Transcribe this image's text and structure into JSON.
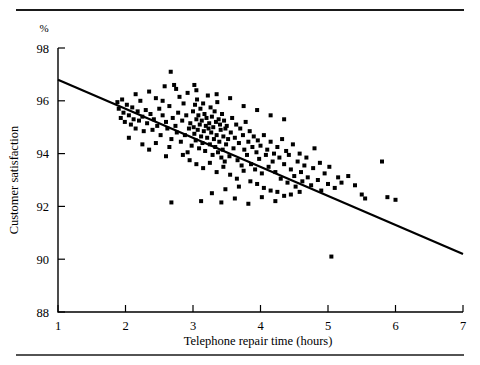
{
  "figure": {
    "name": "telephone-repair-satisfaction-scatter",
    "top_rule": true,
    "bottom_rule": true,
    "percent_symbol": "%"
  },
  "chart_data": {
    "type": "scatter",
    "title": "",
    "subtitle": "",
    "xlabel": "Telephone repair time (hours)",
    "ylabel": "Customer satisfaction",
    "yunit": "%",
    "xlim": [
      1,
      7
    ],
    "ylim": [
      88,
      98
    ],
    "xticks": [
      1,
      2,
      3,
      4,
      5,
      6,
      7
    ],
    "yticks": [
      88,
      90,
      92,
      94,
      96,
      98
    ],
    "xticklabels": [
      "1",
      "2",
      "3",
      "4",
      "5",
      "6",
      "7"
    ],
    "yticklabels": [
      "88",
      "90",
      "92",
      "94",
      "96",
      "98"
    ],
    "grid": false,
    "legend": false,
    "marker": "square",
    "marker_color": "#000000",
    "marker_size_px": 4,
    "trendline": {
      "type": "linear-regression",
      "x": [
        1,
        7
      ],
      "y": [
        96.8,
        90.2
      ],
      "slope": -1.1,
      "intercept": 97.9,
      "color": "#000000",
      "width_px": 2.2
    },
    "n_points": 221,
    "points": [
      [
        1.88,
        95.95
      ],
      [
        1.9,
        95.7
      ],
      [
        1.93,
        95.35
      ],
      [
        1.95,
        96.05
      ],
      [
        1.97,
        95.55
      ],
      [
        1.99,
        95.2
      ],
      [
        2.02,
        95.85
      ],
      [
        2.05,
        95.45
      ],
      [
        2.08,
        95.1
      ],
      [
        2.1,
        95.75
      ],
      [
        2.12,
        95.3
      ],
      [
        2.15,
        94.95
      ],
      [
        2.18,
        95.6
      ],
      [
        2.2,
        95.25
      ],
      [
        2.22,
        96.0
      ],
      [
        2.25,
        95.4
      ],
      [
        2.27,
        94.85
      ],
      [
        2.3,
        95.65
      ],
      [
        2.32,
        95.15
      ],
      [
        2.35,
        96.35
      ],
      [
        2.37,
        95.5
      ],
      [
        2.4,
        94.9
      ],
      [
        2.42,
        95.3
      ],
      [
        2.45,
        96.1
      ],
      [
        2.47,
        95.05
      ],
      [
        2.5,
        95.7
      ],
      [
        2.52,
        94.7
      ],
      [
        2.55,
        95.45
      ],
      [
        2.58,
        96.55
      ],
      [
        2.6,
        95.2
      ],
      [
        2.62,
        94.95
      ],
      [
        2.65,
        95.8
      ],
      [
        2.67,
        97.1
      ],
      [
        2.68,
        94.55
      ],
      [
        2.7,
        95.35
      ],
      [
        2.72,
        96.6
      ],
      [
        2.74,
        95.05
      ],
      [
        2.76,
        94.8
      ],
      [
        2.78,
        95.55
      ],
      [
        2.8,
        96.15
      ],
      [
        2.82,
        94.45
      ],
      [
        2.84,
        95.25
      ],
      [
        2.86,
        95.9
      ],
      [
        2.88,
        94.7
      ],
      [
        2.9,
        95.45
      ],
      [
        2.92,
        96.3
      ],
      [
        2.94,
        94.95
      ],
      [
        2.96,
        95.15
      ],
      [
        2.98,
        94.3
      ],
      [
        3.0,
        95.6
      ],
      [
        3.01,
        95.0
      ],
      [
        3.02,
        94.75
      ],
      [
        3.03,
        95.85
      ],
      [
        3.04,
        94.5
      ],
      [
        3.05,
        95.3
      ],
      [
        3.06,
        96.05
      ],
      [
        3.07,
        94.9
      ],
      [
        3.08,
        95.45
      ],
      [
        3.09,
        94.2
      ],
      [
        3.1,
        95.1
      ],
      [
        3.11,
        95.7
      ],
      [
        3.12,
        94.65
      ],
      [
        3.13,
        95.25
      ],
      [
        3.14,
        94.4
      ],
      [
        3.15,
        95.9
      ],
      [
        3.16,
        94.85
      ],
      [
        3.17,
        95.5
      ],
      [
        3.18,
        94.1
      ],
      [
        3.19,
        95.05
      ],
      [
        3.2,
        95.35
      ],
      [
        3.21,
        94.6
      ],
      [
        3.22,
        96.2
      ],
      [
        3.23,
        94.95
      ],
      [
        3.24,
        95.15
      ],
      [
        3.25,
        94.35
      ],
      [
        3.26,
        95.75
      ],
      [
        3.27,
        94.8
      ],
      [
        3.28,
        95.4
      ],
      [
        3.29,
        93.95
      ],
      [
        3.3,
        95.0
      ],
      [
        3.31,
        94.55
      ],
      [
        3.32,
        95.6
      ],
      [
        3.33,
        94.25
      ],
      [
        3.34,
        95.2
      ],
      [
        3.35,
        94.7
      ],
      [
        3.36,
        95.95
      ],
      [
        3.37,
        94.05
      ],
      [
        3.38,
        95.3
      ],
      [
        3.39,
        94.45
      ],
      [
        3.4,
        95.1
      ],
      [
        3.41,
        94.9
      ],
      [
        3.42,
        93.85
      ],
      [
        3.43,
        95.5
      ],
      [
        3.44,
        94.15
      ],
      [
        3.45,
        94.65
      ],
      [
        3.46,
        95.25
      ],
      [
        3.47,
        93.7
      ],
      [
        3.48,
        94.95
      ],
      [
        3.49,
        94.35
      ],
      [
        3.5,
        95.05
      ],
      [
        3.52,
        94.55
      ],
      [
        3.54,
        93.9
      ],
      [
        3.56,
        94.8
      ],
      [
        3.58,
        95.35
      ],
      [
        3.6,
        94.2
      ],
      [
        3.62,
        94.6
      ],
      [
        3.64,
        95.1
      ],
      [
        3.66,
        93.75
      ],
      [
        3.68,
        94.4
      ],
      [
        3.7,
        94.95
      ],
      [
        3.72,
        93.55
      ],
      [
        3.74,
        94.7
      ],
      [
        3.76,
        94.15
      ],
      [
        3.78,
        95.2
      ],
      [
        3.8,
        93.95
      ],
      [
        3.82,
        94.45
      ],
      [
        3.84,
        94.85
      ],
      [
        3.86,
        93.6
      ],
      [
        3.88,
        94.25
      ],
      [
        3.9,
        94.65
      ],
      [
        3.92,
        93.4
      ],
      [
        3.94,
        94.05
      ],
      [
        3.96,
        94.5
      ],
      [
        3.98,
        93.8
      ],
      [
        4.0,
        94.3
      ],
      [
        4.02,
        93.25
      ],
      [
        4.05,
        94.7
      ],
      [
        4.08,
        93.95
      ],
      [
        4.1,
        94.15
      ],
      [
        4.12,
        93.5
      ],
      [
        4.15,
        94.45
      ],
      [
        4.18,
        93.7
      ],
      [
        4.2,
        94.0
      ],
      [
        4.22,
        93.3
      ],
      [
        4.25,
        94.25
      ],
      [
        4.28,
        93.85
      ],
      [
        4.3,
        93.05
      ],
      [
        4.32,
        94.55
      ],
      [
        4.35,
        93.6
      ],
      [
        4.38,
        94.1
      ],
      [
        4.4,
        92.9
      ],
      [
        4.42,
        93.95
      ],
      [
        4.45,
        93.4
      ],
      [
        4.48,
        94.35
      ],
      [
        4.5,
        93.15
      ],
      [
        4.52,
        92.75
      ],
      [
        4.55,
        93.7
      ],
      [
        4.58,
        94.0
      ],
      [
        4.6,
        93.3
      ],
      [
        4.62,
        92.95
      ],
      [
        4.65,
        93.55
      ],
      [
        4.68,
        93.85
      ],
      [
        4.7,
        93.1
      ],
      [
        4.75,
        92.8
      ],
      [
        4.78,
        93.45
      ],
      [
        4.8,
        94.2
      ],
      [
        4.85,
        93.0
      ],
      [
        4.88,
        93.65
      ],
      [
        4.9,
        92.6
      ],
      [
        4.95,
        93.25
      ],
      [
        5.0,
        92.85
      ],
      [
        5.02,
        93.5
      ],
      [
        5.05,
        90.1
      ],
      [
        5.1,
        92.7
      ],
      [
        5.15,
        93.1
      ],
      [
        5.2,
        92.9
      ],
      [
        5.3,
        93.15
      ],
      [
        5.4,
        92.8
      ],
      [
        5.5,
        92.45
      ],
      [
        5.55,
        92.3
      ],
      [
        5.8,
        93.7
      ],
      [
        5.88,
        92.35
      ],
      [
        6.0,
        92.25
      ],
      [
        2.05,
        94.6
      ],
      [
        2.25,
        94.35
      ],
      [
        2.45,
        94.4
      ],
      [
        2.65,
        94.25
      ],
      [
        2.85,
        93.95
      ],
      [
        2.95,
        93.75
      ],
      [
        3.05,
        93.6
      ],
      [
        3.15,
        93.45
      ],
      [
        3.25,
        93.65
      ],
      [
        3.35,
        93.3
      ],
      [
        3.45,
        93.5
      ],
      [
        3.55,
        93.2
      ],
      [
        3.65,
        93.05
      ],
      [
        3.75,
        93.35
      ],
      [
        3.85,
        92.95
      ],
      [
        3.95,
        92.85
      ],
      [
        4.05,
        92.7
      ],
      [
        4.15,
        92.6
      ],
      [
        4.25,
        92.55
      ],
      [
        4.35,
        92.4
      ],
      [
        2.15,
        96.25
      ],
      [
        2.55,
        96.0
      ],
      [
        2.75,
        96.45
      ],
      [
        3.05,
        96.4
      ],
      [
        3.35,
        96.25
      ],
      [
        3.55,
        96.1
      ],
      [
        3.75,
        95.8
      ],
      [
        3.95,
        95.65
      ],
      [
        4.15,
        95.45
      ],
      [
        4.35,
        95.3
      ],
      [
        2.35,
        94.15
      ],
      [
        2.6,
        93.9
      ],
      [
        3.12,
        92.2
      ],
      [
        3.42,
        92.15
      ],
      [
        2.68,
        92.15
      ],
      [
        3.62,
        92.3
      ],
      [
        3.82,
        92.1
      ],
      [
        4.02,
        92.35
      ],
      [
        4.22,
        92.2
      ],
      [
        4.45,
        92.45
      ],
      [
        3.28,
        92.5
      ],
      [
        3.48,
        92.65
      ],
      [
        3.68,
        92.75
      ],
      [
        2.92,
        94.05
      ],
      [
        3.02,
        96.6
      ],
      [
        4.58,
        92.55
      ]
    ]
  }
}
